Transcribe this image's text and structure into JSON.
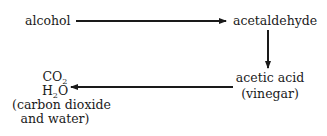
{
  "diagram": {
    "nodes": {
      "alcohol": "alcohol",
      "acetaldehyde": "acetaldehyde",
      "acetic_acid": {
        "line1": "acetic acid",
        "line2": "(vinegar)"
      },
      "products": {
        "co2": {
          "base": "CO",
          "sub": "2"
        },
        "h2o": {
          "pre": "H",
          "sub": "2",
          "post": "O"
        },
        "line3": "(carbon dioxide",
        "line4": "and water)"
      }
    },
    "edges": [
      {
        "from": "alcohol",
        "to": "acetaldehyde"
      },
      {
        "from": "acetaldehyde",
        "to": "acetic acid"
      },
      {
        "from": "acetic acid",
        "to": "CO2 H2O"
      }
    ]
  }
}
